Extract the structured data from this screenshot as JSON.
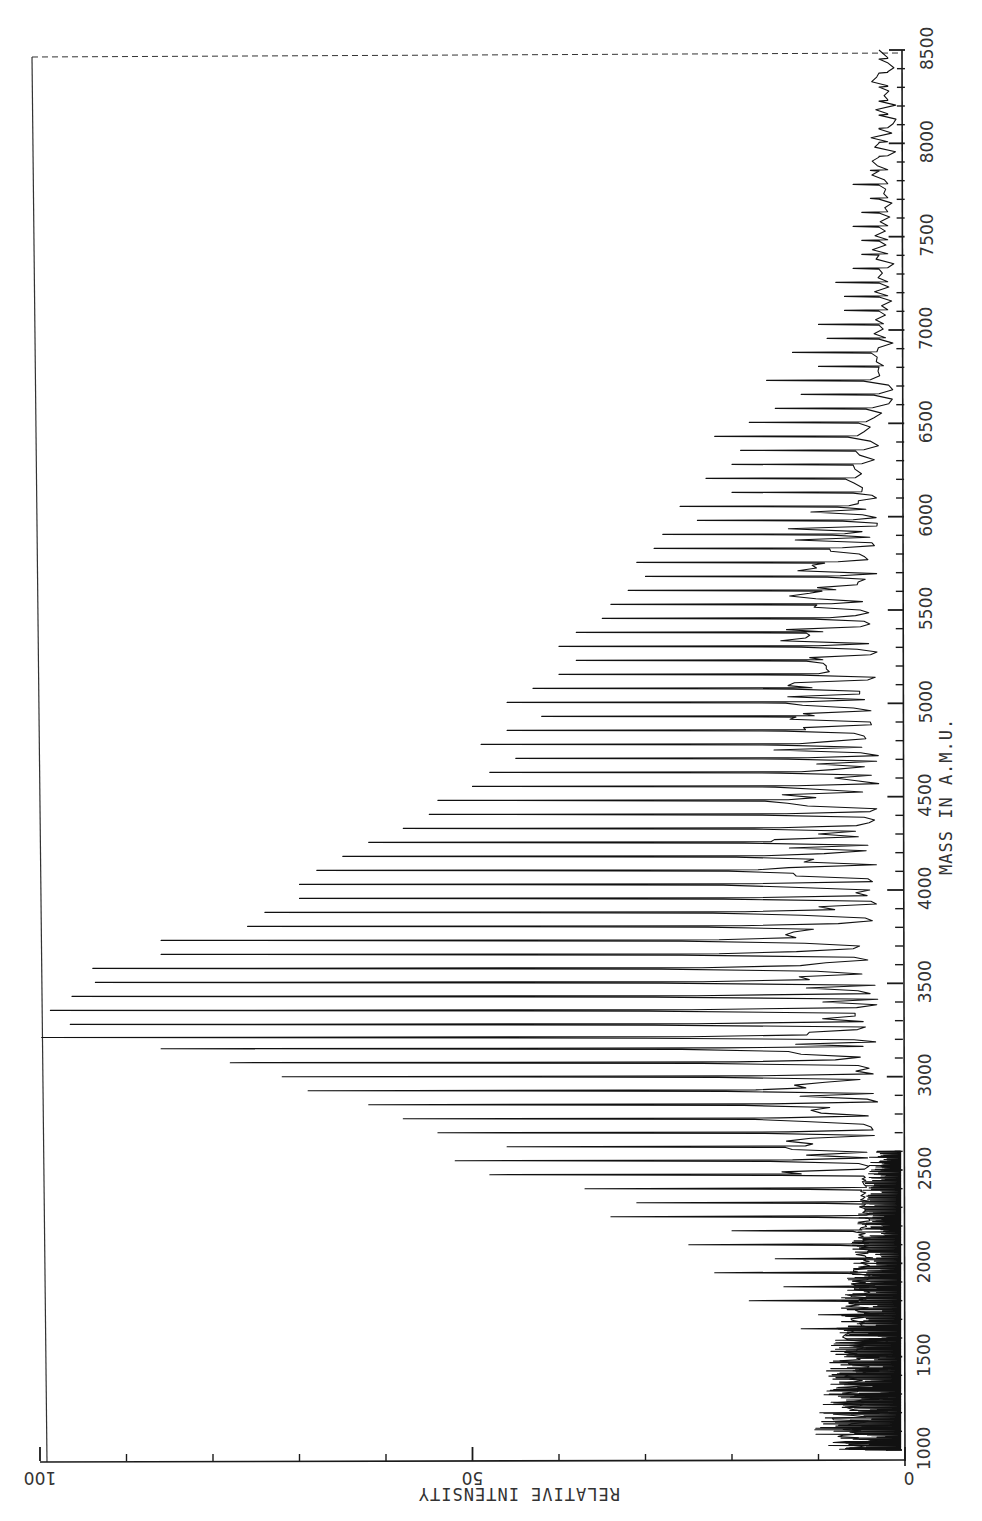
{
  "chart_data": {
    "type": "line",
    "title": "",
    "orientation": "rotated 90deg (mass axis vertical on right, intensity axis horizontal at bottom, increasing leftward)",
    "xlabel": "MASS IN A.M.U.",
    "ylabel": "RELATIVE INTENSITY",
    "xlim": [
      1000,
      8500
    ],
    "ylim": [
      0,
      100
    ],
    "x_ticks": [
      1000,
      1500,
      2000,
      2500,
      3000,
      3500,
      4000,
      4500,
      5000,
      5500,
      6000,
      6500,
      7000,
      7500,
      8000,
      8500
    ],
    "x_minor_tick_step": 100,
    "y_ticks": [
      0,
      50,
      100
    ],
    "y_tick_labels": [
      "0",
      "50",
      "100"
    ],
    "y_minor_tick_step": 10,
    "grid": false,
    "legend": null,
    "peak_spacing_amu": 75,
    "peaks": {
      "mass": [
        1050,
        1125,
        1200,
        1275,
        1350,
        1425,
        1500,
        1575,
        1650,
        1725,
        1800,
        1875,
        1950,
        2025,
        2100,
        2175,
        2250,
        2325,
        2400,
        2475,
        2550,
        2625,
        2700,
        2775,
        2850,
        2925,
        3000,
        3075,
        3150,
        3210,
        3280,
        3355,
        3430,
        3505,
        3580,
        3655,
        3730,
        3805,
        3880,
        3955,
        4030,
        4105,
        4180,
        4255,
        4330,
        4405,
        4480,
        4555,
        4630,
        4705,
        4780,
        4855,
        4930,
        5005,
        5080,
        5155,
        5230,
        5305,
        5380,
        5455,
        5530,
        5605,
        5680,
        5755,
        5830,
        5905,
        5980,
        6055,
        6130,
        6205,
        6280,
        6355,
        6430,
        6505,
        6580,
        6655,
        6730,
        6805,
        6880,
        6955,
        7030,
        7105,
        7180,
        7255,
        7330,
        7405,
        7480,
        7555,
        7630,
        7705,
        7780,
        7855,
        7930,
        8005,
        8080,
        8155,
        8230,
        8305,
        8380,
        8455
      ],
      "intensity": [
        4,
        5,
        6,
        5,
        7,
        6,
        7,
        8,
        12,
        10,
        18,
        14,
        22,
        15,
        25,
        20,
        34,
        31,
        37,
        48,
        52,
        46,
        54,
        58,
        62,
        69,
        72,
        78,
        86,
        99.8,
        96.5,
        98.8,
        96.3,
        93.6,
        93.9,
        86,
        86,
        76,
        74,
        70,
        70,
        68,
        65,
        62,
        58,
        55,
        54,
        50,
        48,
        45,
        49,
        46,
        42,
        46,
        43,
        40,
        38,
        40,
        38,
        35,
        34,
        32,
        30,
        31,
        29,
        28,
        24,
        26,
        20,
        23,
        20,
        19,
        22,
        18,
        15,
        12,
        16,
        10,
        13,
        9,
        10,
        7,
        7,
        8,
        6,
        5,
        5,
        6,
        5,
        4,
        6,
        4,
        3,
        3,
        3,
        2,
        2,
        2,
        2,
        2
      ]
    },
    "baseline_noise": {
      "description": "dense fine-structure noise near baseline between 1000 and ~2500 amu, tapering to small oscillations at high mass",
      "mass_range": [
        1000,
        2500
      ],
      "approx_intensity": [
        2,
        9
      ]
    },
    "max_peak": {
      "mass": 3210,
      "intensity": 100
    }
  },
  "axes": {
    "mass_axis_label": "MASS IN A.M.U.",
    "intensity_axis_label": "RELATIVE INTENSITY",
    "mass_tick_labels": [
      "1000",
      "1500",
      "2000",
      "2500",
      "3000",
      "3500",
      "4000",
      "4500",
      "5000",
      "5500",
      "6000",
      "6500",
      "7000",
      "7500",
      "8000",
      "8500"
    ],
    "intensity_tick_labels": [
      "0",
      "50",
      "100"
    ]
  },
  "colors": {
    "background": "#ffffff",
    "ink": "#111111"
  }
}
